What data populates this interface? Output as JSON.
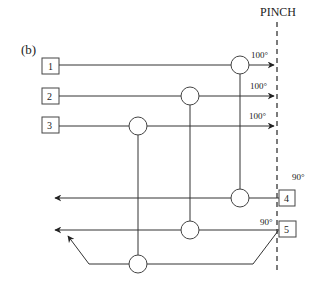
{
  "figure": {
    "panel_label": "(b)",
    "pinch_label": "PINCH",
    "streams": [
      {
        "id": "1",
        "label": "1",
        "type": "hot",
        "target_temp": "100°"
      },
      {
        "id": "2",
        "label": "2",
        "type": "hot",
        "target_temp": "100°"
      },
      {
        "id": "3",
        "label": "3",
        "type": "hot",
        "target_temp": "100°"
      },
      {
        "id": "4",
        "label": "4",
        "type": "cold",
        "supply_temp": "90°"
      },
      {
        "id": "5",
        "label": "5",
        "type": "cold",
        "supply_temp": "90°"
      }
    ],
    "exchangers": [
      {
        "id": "E1",
        "hot": "1",
        "cold": "4"
      },
      {
        "id": "E2",
        "hot": "2",
        "cold": "5"
      },
      {
        "id": "E3",
        "hot": "3",
        "cold": "5-split"
      }
    ],
    "colors": {
      "line": "#333333",
      "background": "#ffffff"
    }
  }
}
